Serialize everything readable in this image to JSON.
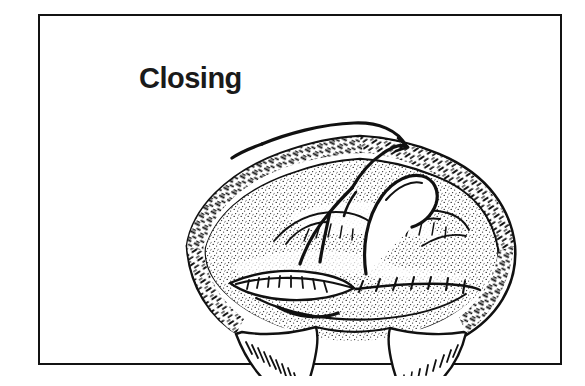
{
  "page": {
    "width": 585,
    "height": 386,
    "background_color": "#ffffff",
    "ink_color": "#111111"
  },
  "frame": {
    "name": "illustration-border",
    "style": "solid rectangular rule",
    "color": "#131313",
    "thickness_px": 2.5,
    "left": 38,
    "top": 14,
    "width": 524,
    "height": 351
  },
  "title": {
    "text": "Closing",
    "font_weight": "bold",
    "font_size_px": 29,
    "color": "#1a1a1a",
    "left": 99,
    "top": 48
  },
  "illustration": {
    "name": "surgical-wound-closure-diagram",
    "medium": "black-and-white pen-and-ink line drawing",
    "subject": "Closing of a surgical incision with a running suture",
    "caption": "Closing",
    "left": 130,
    "top": 80,
    "width": 360,
    "height": 280,
    "elements": [
      {
        "name": "retractor-tissue-edge-upper-left",
        "description": "Retracted tissue band with dense cross-hatch shading, upper-left sweep",
        "texture": "cross-hatched short strokes"
      },
      {
        "name": "retractor-tissue-edge-upper-right",
        "description": "Retracted tissue band with dense cross-hatch shading, upper-right sweep",
        "texture": "cross-hatched short strokes"
      },
      {
        "name": "retractor-tissue-edge-left",
        "description": "Lower-left retracted wound margin, hatched",
        "texture": "cross-hatched short strokes"
      },
      {
        "name": "retractor-tissue-edge-right",
        "description": "Lower-right retracted wound margin, hatched",
        "texture": "cross-hatched short strokes"
      },
      {
        "name": "exposed-tissue-field",
        "description": "Central stippled tissue surface seen through the open retractors",
        "texture": "fine stipple dots"
      },
      {
        "name": "sutured-incision-line",
        "description": "Horizontal closed incision across the field with transverse stitch marks",
        "stitch_count": 13
      },
      {
        "name": "suture-thread",
        "description": "Long curved suture thread looping up and out of the field toward the upper left"
      },
      {
        "name": "needle-loop",
        "description": "Curved needle carrying the suture through the near wound edge"
      },
      {
        "name": "thread-tail",
        "description": "Free end of the suture lying across the lower incision"
      },
      {
        "name": "surgical-drape-left",
        "description": "Draped cloth fold at lower left with comb-like shading strokes"
      },
      {
        "name": "surgical-drape-right",
        "description": "Draped cloth fold at lower right with dash shading strokes"
      }
    ]
  }
}
